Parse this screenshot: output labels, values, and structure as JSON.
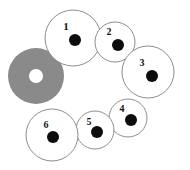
{
  "diagram": {
    "canvas": {
      "width": 190,
      "height": 170,
      "background": "#ffffff"
    },
    "colors": {
      "circle_fill": "#ffffff",
      "circle_stroke": "#8e8e8e",
      "dot_fill": "#0d0d0d",
      "label_fill": "#141414",
      "annulus_fill": "#8a8a8a",
      "annulus_hole_fill": "#ffffff"
    },
    "nodes": [
      {
        "id": "node-1",
        "label": "1",
        "cx": 73,
        "cy": 38,
        "r": 28,
        "dot_cx": 75,
        "dot_cy": 40,
        "dot_r": 6,
        "label_x": 66,
        "label_y": 27,
        "label_size": 11
      },
      {
        "id": "node-2",
        "label": "2",
        "cx": 115,
        "cy": 42,
        "r": 20,
        "dot_cx": 118,
        "dot_cy": 45,
        "dot_r": 6,
        "label_x": 109,
        "label_y": 33,
        "label_size": 10
      },
      {
        "id": "node-3",
        "label": "3",
        "cx": 148,
        "cy": 72,
        "r": 26,
        "dot_cx": 152,
        "dot_cy": 76,
        "dot_r": 6,
        "label_x": 142,
        "label_y": 64,
        "label_size": 10
      },
      {
        "id": "node-4",
        "label": "4",
        "cx": 128,
        "cy": 118,
        "r": 19,
        "dot_cx": 131,
        "dot_cy": 120,
        "dot_r": 6,
        "label_x": 122,
        "label_y": 110,
        "label_size": 10
      },
      {
        "id": "node-5",
        "label": "5",
        "cx": 95,
        "cy": 130,
        "r": 19,
        "dot_cx": 97,
        "dot_cy": 132,
        "dot_r": 6,
        "label_x": 89,
        "label_y": 123,
        "label_size": 10
      },
      {
        "id": "node-6",
        "label": "6",
        "cx": 52,
        "cy": 135,
        "r": 26,
        "dot_cx": 53,
        "dot_cy": 137,
        "dot_r": 6,
        "label_x": 46,
        "label_y": 126,
        "label_size": 10
      }
    ],
    "annulus": {
      "id": "gray-annulus",
      "cx": 36,
      "cy": 76,
      "outer_r": 28,
      "hole_r": 7,
      "fill": "#8a8a8a",
      "hole_fill": "#ffffff"
    }
  }
}
